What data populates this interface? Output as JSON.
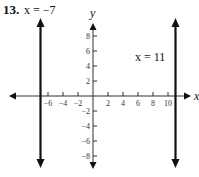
{
  "problem": {
    "number": "13.",
    "left_label": "x = −7",
    "right_label": "x = 11"
  },
  "chart_data": {
    "type": "line",
    "title": "",
    "xlabel": "x",
    "ylabel": "y",
    "xlim": [
      -10.5,
      13
    ],
    "ylim": [
      -10.5,
      10.5
    ],
    "grid": false,
    "x_ticks": [
      -6,
      -4,
      -2,
      2,
      4,
      6,
      8,
      10
    ],
    "x_tick_labels": [
      "−6",
      "−4",
      "−2",
      "2",
      "4",
      "6",
      "8",
      "10"
    ],
    "y_ticks": [
      8,
      6,
      4,
      2,
      -2,
      -4,
      -6,
      -8
    ],
    "y_tick_labels": [
      "8",
      "6",
      "4",
      "2",
      "−2",
      "−4",
      "−6",
      "−8"
    ],
    "series": [
      {
        "name": "x = −7",
        "type": "vertical-line",
        "x": -7,
        "arrows": "both"
      },
      {
        "name": "x = 11",
        "type": "vertical-line",
        "x": 11,
        "arrows": "both"
      }
    ],
    "annotations": [
      {
        "text": "x = −7",
        "near": "top-left"
      },
      {
        "text": "x = 11",
        "near": "right line, y≈6"
      }
    ],
    "colors": {
      "lines": "#111111",
      "axes": "#333333"
    }
  }
}
